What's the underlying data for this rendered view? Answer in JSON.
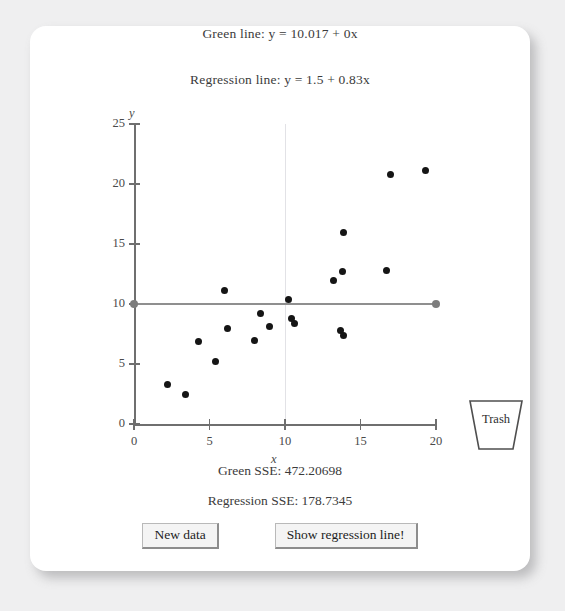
{
  "equations": {
    "green_line": "Green line: y = 10.017 + 0x",
    "regression_line": "Regression line: y = 1.5 + 0.83x"
  },
  "sse": {
    "green": "Green SSE: 472.20698",
    "regression": "Regression SSE: 178.7345"
  },
  "buttons": {
    "new_data": "New data",
    "show_regression": "Show regression line!"
  },
  "trash": {
    "label": "Trash"
  },
  "colors": {
    "page_background": "#efeff0",
    "card_background": "#ffffff",
    "axis": "#6f6f6f",
    "green_line": "#8f8f8f",
    "point": "#151515",
    "gridline": "#e2e2e6",
    "button_face": "#f4f4f4"
  },
  "chart_data": {
    "type": "scatter",
    "title": "",
    "xlabel": "x",
    "ylabel": "y",
    "xlim": [
      0,
      20
    ],
    "ylim": [
      0,
      25
    ],
    "xticks": [
      0,
      5,
      10,
      15,
      20
    ],
    "yticks": [
      0,
      5,
      10,
      15,
      20,
      25
    ],
    "grid": "vertical gridline at x = 10 only",
    "legend": "none",
    "points": [
      {
        "x": 2.2,
        "y": 3.3
      },
      {
        "x": 3.4,
        "y": 2.5
      },
      {
        "x": 4.3,
        "y": 6.9
      },
      {
        "x": 5.4,
        "y": 5.2
      },
      {
        "x": 6.0,
        "y": 11.1
      },
      {
        "x": 6.2,
        "y": 8.0
      },
      {
        "x": 8.0,
        "y": 7.0
      },
      {
        "x": 8.4,
        "y": 9.2
      },
      {
        "x": 9.0,
        "y": 8.1
      },
      {
        "x": 10.2,
        "y": 10.4
      },
      {
        "x": 10.4,
        "y": 8.8
      },
      {
        "x": 10.6,
        "y": 8.4
      },
      {
        "x": 13.2,
        "y": 12.0
      },
      {
        "x": 13.7,
        "y": 7.8
      },
      {
        "x": 13.9,
        "y": 7.4
      },
      {
        "x": 13.8,
        "y": 12.7
      },
      {
        "x": 13.9,
        "y": 16.0
      },
      {
        "x": 16.7,
        "y": 12.8
      },
      {
        "x": 17.0,
        "y": 20.8
      },
      {
        "x": 19.3,
        "y": 21.1
      }
    ],
    "lines": [
      {
        "name": "green-line",
        "type": "horizontal",
        "intercept": 10.017,
        "slope": 0,
        "drawn": true,
        "x_from": 0,
        "x_to": 20
      },
      {
        "name": "regression-line",
        "type": "linear",
        "intercept": 1.5,
        "slope": 0.83,
        "drawn": false,
        "x_from": 0,
        "x_to": 20
      }
    ]
  }
}
